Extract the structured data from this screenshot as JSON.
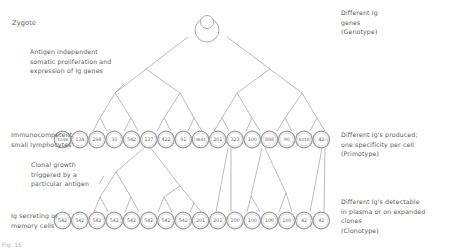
{
  "labels": {
    "zygote": "Zygote",
    "antigen_independent": [
      "Antigen independent",
      "somatic proliferation and",
      "expression of Ig genes"
    ],
    "immunocompetent": [
      "Immunocompetent",
      "small lymphocytes"
    ],
    "clonal_growth": [
      "Clonal growth",
      "triggered by a",
      "particular antigen"
    ],
    "ig_secreting": [
      "Ig secreting or",
      "memory cells"
    ],
    "genotype": [
      "Different Ig",
      "genes",
      "(Genotype)"
    ],
    "primotype": [
      "Different Ig's produced;",
      "one specificity per cell",
      "(Primotype)"
    ],
    "clonotype": [
      "Different Ig's detectable",
      "in plasma or on expanded",
      "clones",
      "(Clonotype)"
    ]
  },
  "caption": "Fig. 16",
  "lymphocytes": [
    "1246",
    "134",
    "298",
    "30",
    "542",
    "137",
    "422",
    "91",
    "3641",
    "201",
    "323",
    "100",
    "898",
    "90",
    "6310",
    "42"
  ],
  "secreting_cells": [
    "542",
    "542",
    "542",
    "542",
    "542",
    "542",
    "542",
    "542",
    "201",
    "201",
    "100",
    "100",
    "100",
    "100",
    "42",
    "42"
  ],
  "colors": {
    "line": "#8a8a8a",
    "text": "#5a5a5a"
  }
}
